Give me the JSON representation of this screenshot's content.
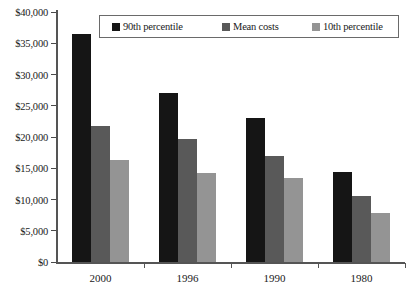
{
  "chart_data": {
    "type": "bar",
    "title": "",
    "subtitle": "",
    "xlabel": "",
    "ylabel": "",
    "categories": [
      "2000",
      "1996",
      "1990",
      "1980"
    ],
    "series": [
      {
        "name": "90th percentile",
        "color": "#151515",
        "values": [
          36500,
          27100,
          23000,
          14400
        ]
      },
      {
        "name": "Mean costs",
        "color": "#595959",
        "values": [
          21800,
          19700,
          16900,
          10600
        ]
      },
      {
        "name": "10th percentile",
        "color": "#949494",
        "values": [
          16300,
          14200,
          13400,
          7800
        ]
      }
    ],
    "ylim": [
      0,
      40000
    ],
    "ytick_values": [
      0,
      5000,
      10000,
      15000,
      20000,
      25000,
      30000,
      35000,
      40000
    ],
    "ytick_labels": [
      "$0",
      "$5,000",
      "$10,000",
      "$15,000",
      "$20,000",
      "$25,000",
      "$30,000",
      "$35,000",
      "$40,000"
    ],
    "grid": false,
    "legend_position": "top-center",
    "legend_entries": [
      "90th percentile",
      "Mean costs",
      "10th percentile"
    ]
  }
}
